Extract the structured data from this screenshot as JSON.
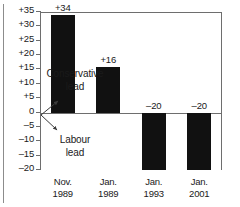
{
  "chart_data": {
    "type": "bar",
    "title": "",
    "xlabel": "",
    "ylabel": "",
    "categories": [
      "Nov. 1989",
      "Jan. 1989",
      "Jan. 1993",
      "Jan. 2001"
    ],
    "category_lines": [
      [
        "Nov.",
        "1989"
      ],
      [
        "Jan.",
        "1989"
      ],
      [
        "Jan.",
        "1993"
      ],
      [
        "Jan.",
        "2001"
      ]
    ],
    "values": [
      34,
      16,
      -20,
      -20
    ],
    "data_labels": [
      "+34",
      "+16",
      "–20",
      "–20"
    ],
    "ylim": [
      -20,
      35
    ],
    "ytick_values": [
      35,
      30,
      25,
      20,
      15,
      10,
      5,
      0,
      -5,
      -10,
      -15,
      -20
    ],
    "ytick_labels": [
      "+35",
      "+30",
      "+25",
      "+20",
      "+15",
      "+10",
      "+5",
      "0",
      "–5",
      "–10",
      "–15",
      "–20"
    ],
    "grid": false,
    "legend": "none",
    "bar_color": "#111111",
    "axis_color": "#6e6e6e",
    "annotations": [
      {
        "name": "conservative-lead",
        "lines": [
          "Conservative",
          "lead"
        ],
        "direction": "up",
        "anchor_value": 0
      },
      {
        "name": "labour-lead",
        "lines": [
          "Labour",
          "lead"
        ],
        "direction": "down",
        "anchor_value": 0
      }
    ]
  }
}
